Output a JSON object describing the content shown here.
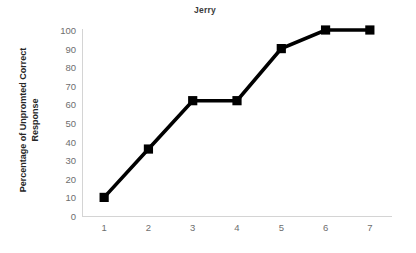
{
  "chart_data": {
    "type": "line",
    "title": "Jerry",
    "xlabel": "",
    "ylabel": "Percentage of Unpromted Correct Response",
    "ylabel_line1": "Percentage of Unpromted Correct",
    "ylabel_line2": "Response",
    "categories": [
      "1",
      "2",
      "3",
      "4",
      "5",
      "6",
      "7"
    ],
    "x": [
      1,
      2,
      3,
      4,
      5,
      6,
      7
    ],
    "values": [
      10,
      36,
      62,
      62,
      90,
      100,
      100
    ],
    "series": [
      {
        "name": "Jerry",
        "values": [
          10,
          36,
          62,
          62,
          90,
          100,
          100
        ],
        "marker": "square",
        "color": "#000000"
      }
    ],
    "ylim": [
      0,
      100
    ],
    "ytick_step": 10,
    "yticks": [
      0,
      10,
      20,
      30,
      40,
      50,
      60,
      70,
      80,
      90,
      100
    ],
    "xticks": [
      "1",
      "2",
      "3",
      "4",
      "5",
      "6",
      "7"
    ],
    "xlim": [
      0.5,
      7.5
    ],
    "grid": false,
    "legend": false,
    "legend_position": "none",
    "background_color": "#ffffff",
    "axis_color": "#d4d4d4",
    "tick_label_color": "#6e6e6e",
    "title_color": "#3b3b3b",
    "label_color": "#262626"
  }
}
